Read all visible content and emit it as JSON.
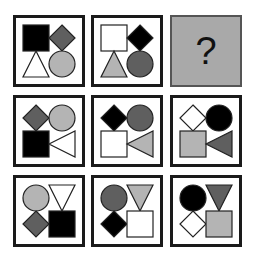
{
  "puzzle": {
    "question_mark": "?",
    "colors": {
      "black": "#000000",
      "dark_gray": "#5f5f5f",
      "light_gray": "#b4b4b4",
      "white": "#ffffff",
      "answer_bg": "#a9a9a9"
    },
    "cells": [
      {
        "row": 1,
        "col": 1,
        "shapes": [
          {
            "type": "square",
            "pos": "top-left",
            "fill": "black"
          },
          {
            "type": "diamond",
            "pos": "top-right",
            "fill": "dark_gray"
          },
          {
            "type": "triangle-up",
            "pos": "bottom-left",
            "fill": "white"
          },
          {
            "type": "circle",
            "pos": "bottom-right",
            "fill": "light_gray"
          }
        ]
      },
      {
        "row": 1,
        "col": 2,
        "shapes": [
          {
            "type": "square",
            "pos": "top-left",
            "fill": "white"
          },
          {
            "type": "diamond",
            "pos": "top-right",
            "fill": "black"
          },
          {
            "type": "triangle-up",
            "pos": "bottom-left",
            "fill": "light_gray"
          },
          {
            "type": "circle",
            "pos": "bottom-right",
            "fill": "dark_gray"
          }
        ]
      },
      {
        "row": 1,
        "col": 3,
        "shapes": [],
        "missing": true
      },
      {
        "row": 2,
        "col": 1,
        "shapes": [
          {
            "type": "diamond",
            "pos": "top-left",
            "fill": "dark_gray"
          },
          {
            "type": "circle",
            "pos": "top-right",
            "fill": "light_gray"
          },
          {
            "type": "square",
            "pos": "bottom-left",
            "fill": "black"
          },
          {
            "type": "triangle-left",
            "pos": "bottom-right",
            "fill": "white"
          }
        ]
      },
      {
        "row": 2,
        "col": 2,
        "shapes": [
          {
            "type": "diamond",
            "pos": "top-left",
            "fill": "black"
          },
          {
            "type": "circle",
            "pos": "top-right",
            "fill": "dark_gray"
          },
          {
            "type": "square",
            "pos": "bottom-left",
            "fill": "white"
          },
          {
            "type": "triangle-left",
            "pos": "bottom-right",
            "fill": "light_gray"
          }
        ]
      },
      {
        "row": 2,
        "col": 3,
        "shapes": [
          {
            "type": "diamond",
            "pos": "top-left",
            "fill": "white"
          },
          {
            "type": "circle",
            "pos": "top-right",
            "fill": "black"
          },
          {
            "type": "square",
            "pos": "bottom-left",
            "fill": "light_gray"
          },
          {
            "type": "triangle-left",
            "pos": "bottom-right",
            "fill": "dark_gray"
          }
        ]
      },
      {
        "row": 3,
        "col": 1,
        "shapes": [
          {
            "type": "circle",
            "pos": "top-left",
            "fill": "light_gray"
          },
          {
            "type": "triangle-down",
            "pos": "top-right",
            "fill": "white"
          },
          {
            "type": "diamond",
            "pos": "bottom-left",
            "fill": "dark_gray"
          },
          {
            "type": "square",
            "pos": "bottom-right",
            "fill": "black"
          }
        ]
      },
      {
        "row": 3,
        "col": 2,
        "shapes": [
          {
            "type": "circle",
            "pos": "top-left",
            "fill": "dark_gray"
          },
          {
            "type": "triangle-down",
            "pos": "top-right",
            "fill": "light_gray"
          },
          {
            "type": "diamond",
            "pos": "bottom-left",
            "fill": "black"
          },
          {
            "type": "square",
            "pos": "bottom-right",
            "fill": "white"
          }
        ]
      },
      {
        "row": 3,
        "col": 3,
        "shapes": [
          {
            "type": "circle",
            "pos": "top-left",
            "fill": "black"
          },
          {
            "type": "triangle-down",
            "pos": "top-right",
            "fill": "dark_gray"
          },
          {
            "type": "diamond",
            "pos": "bottom-left",
            "fill": "white"
          },
          {
            "type": "square",
            "pos": "bottom-right",
            "fill": "light_gray"
          }
        ]
      }
    ]
  }
}
